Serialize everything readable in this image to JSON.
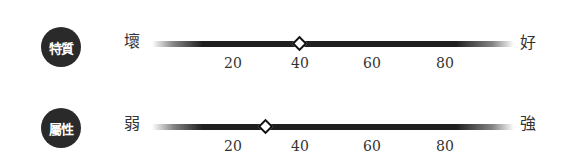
{
  "scale": {
    "ticks": [
      "20",
      "40",
      "60",
      "80"
    ],
    "tick_x": [
      233,
      302,
      372,
      445
    ],
    "min": 0,
    "max": 100
  },
  "rows": [
    {
      "badge": "特質",
      "left_label": "壞",
      "right_label": "好",
      "value": 40
    },
    {
      "badge": "屬性",
      "left_label": "弱",
      "right_label": "強",
      "value": 30
    }
  ],
  "colors": {
    "badge_bg": "#2a2a2a",
    "bar": "#1f1f1f",
    "marker_fill": "#ffffff",
    "marker_border": "#111111"
  }
}
